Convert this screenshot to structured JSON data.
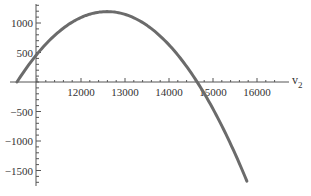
{
  "chart_data": {
    "type": "line",
    "title": "",
    "xlabel": "v2",
    "xlabel_main": "v",
    "xlabel_sub": "2",
    "ylabel": "",
    "xlim": [
      10545,
      16700
    ],
    "ylim": [
      -1750,
      1300
    ],
    "grid": false,
    "legend": null,
    "x_ticks": [
      12000,
      13000,
      14000,
      15000,
      16000
    ],
    "x_tick_labels": [
      "12000",
      "13000",
      "14000",
      "15000",
      "16000"
    ],
    "y_ticks": [
      1000,
      500,
      -500,
      -1000,
      -1500
    ],
    "y_tick_labels": [
      "1000",
      "500",
      "−5000",
      "−1000",
      "−1500"
    ],
    "series": [
      {
        "name": "curve",
        "color": "#6b6b6b",
        "shape": "downward parabola",
        "x": [
          10545,
          10884,
          11000,
          11500,
          12000,
          12500,
          12700,
          13000,
          13500,
          14000,
          14500,
          14640,
          15000,
          15500,
          15770
        ],
        "y": [
          0,
          362,
          465,
          842,
          1120,
          1185,
          1190,
          1150,
          970,
          625,
          180,
          0,
          -450,
          -1200,
          -1700
        ]
      }
    ],
    "annotations": []
  }
}
